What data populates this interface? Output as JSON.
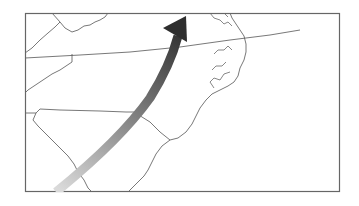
{
  "map": {
    "region": "Southeastern United States (North Carolina, South Carolina, Virginia)",
    "frame_color": "#666666",
    "border_color": "#555555",
    "background": "#ffffff",
    "arrow": {
      "direction": "southwest-to-northeast",
      "gradient_start": "#d8d8d8",
      "gradient_end": "#2e2e2e"
    }
  }
}
